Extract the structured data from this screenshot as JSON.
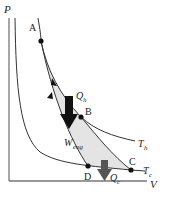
{
  "diagram": {
    "type": "Carnot cycle P-V diagram",
    "axes": {
      "y_label": "P",
      "x_label": "V"
    },
    "points": [
      {
        "id": "A",
        "label": "A"
      },
      {
        "id": "B",
        "label": "B"
      },
      {
        "id": "C",
        "label": "C"
      },
      {
        "id": "D",
        "label": "D"
      }
    ],
    "isotherms": [
      {
        "id": "hot",
        "label": "T",
        "subscript": "h"
      },
      {
        "id": "cold",
        "label": "T",
        "subscript": "c"
      }
    ],
    "heat_in": {
      "label": "Q",
      "subscript": "h"
    },
    "heat_out": {
      "label": "Q",
      "subscript": "c"
    },
    "work": {
      "label": "W",
      "subscript": "eng"
    },
    "colors": {
      "curve": "#333333",
      "axis": "#777777",
      "fill": "#e4e4e4",
      "arrow_hot": "#111111",
      "arrow_cold": "#555555"
    }
  }
}
